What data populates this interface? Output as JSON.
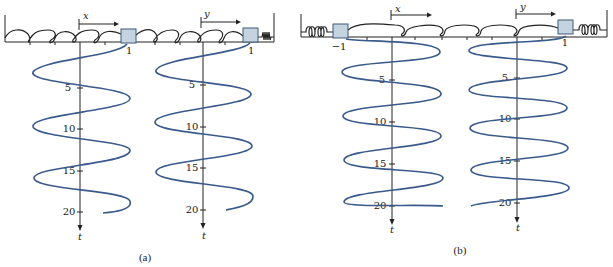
{
  "figure": {
    "panels": [
      {
        "id": "a",
        "caption": "(a)",
        "description": "Two masses coupled by springs between fixed walls; positions x and y plotted against time t",
        "displacement_labels": [
          "x",
          "y"
        ],
        "mass_labels": [
          "1",
          "1"
        ],
        "axes": [
          {
            "variable": "x",
            "time_label": "t",
            "ticks": [
              "5",
              "10",
              "15",
              "20"
            ]
          },
          {
            "variable": "y",
            "time_label": "t",
            "ticks": [
              "5",
              "10",
              "15",
              "20"
            ]
          }
        ]
      },
      {
        "id": "b",
        "caption": "(b)",
        "description": "Two masses attached to walls by springs and coupled to each other; positions x and y plotted against time t",
        "displacement_labels": [
          "x",
          "y"
        ],
        "mass_labels": [
          "−1",
          "1"
        ],
        "axes": [
          {
            "variable": "x",
            "time_label": "t",
            "ticks": [
              "5",
              "10",
              "15",
              "20"
            ]
          },
          {
            "variable": "y",
            "time_label": "t",
            "ticks": [
              "5",
              "10",
              "15",
              "20"
            ]
          }
        ]
      }
    ],
    "colors": {
      "curve": "#3a5a8c",
      "block_fill": "#c3d3e0",
      "ink": "#222222"
    }
  }
}
